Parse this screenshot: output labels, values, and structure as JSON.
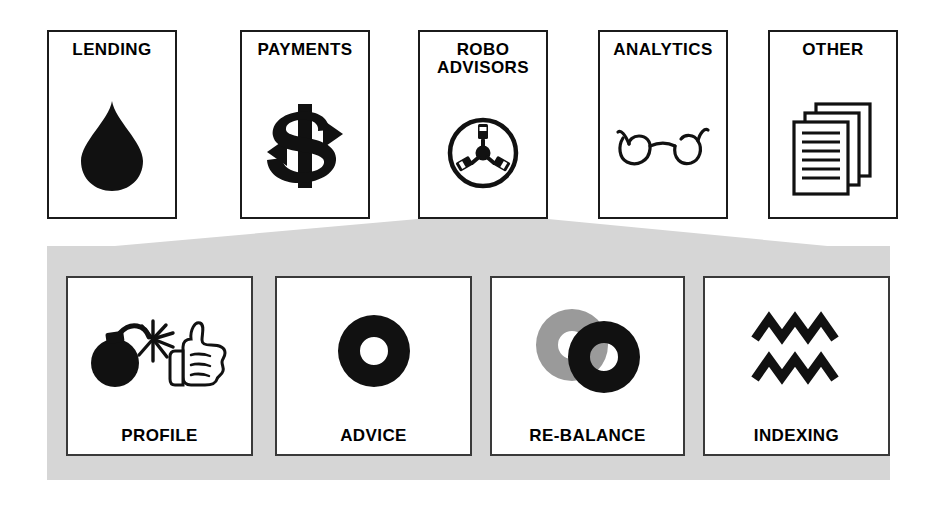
{
  "diagram": {
    "title_row": [
      {
        "id": "lending",
        "label": "LENDING",
        "icon": "water-drop-icon"
      },
      {
        "id": "payments",
        "label": "PAYMENTS",
        "icon": "dollar-sign-icon"
      },
      {
        "id": "robo",
        "label": "ROBO\nADVISORS",
        "label_line1": "ROBO",
        "label_line2": "ADVISORS",
        "icon": "three-pin-socket-icon"
      },
      {
        "id": "analytics",
        "label": "ANALYTICS",
        "icon": "eyeglasses-icon"
      },
      {
        "id": "other",
        "label": "OTHER",
        "icon": "stacked-documents-icon"
      }
    ],
    "sub_row": [
      {
        "id": "profile",
        "label": "PROFILE",
        "icon": "bomb-and-thumbs-up-icon"
      },
      {
        "id": "advice",
        "label": "ADVICE",
        "icon": "black-donut-icon"
      },
      {
        "id": "rebalance",
        "label": "RE-BALANCE",
        "icon": "two-overlapping-donuts-icon"
      },
      {
        "id": "indexing",
        "label": "INDEXING",
        "icon": "double-zigzag-icon"
      }
    ],
    "connector": {
      "name": "funnel-connector",
      "from": "ROBO ADVISORS",
      "to": "PROFILE / ADVICE / RE-BALANCE / INDEXING"
    },
    "colors": {
      "panel_gray": "#d6d6d6",
      "icon_black": "#111111",
      "icon_gray": "#9a9a9a",
      "card_border": "#1b1b1b",
      "background": "#ffffff"
    }
  }
}
